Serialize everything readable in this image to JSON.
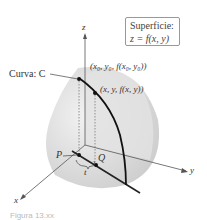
{
  "figure": {
    "surface_box": {
      "line1": "Superficie:",
      "line2": "z = f(x, y)"
    },
    "labels": {
      "curve": "Curva: C",
      "point_top": "(x₀, y₀, f(x₀, y₀))",
      "point_mid": "(x, y, f(x, y))",
      "P": "P",
      "Q": "Q",
      "t": "t",
      "axis_x": "x",
      "axis_y": "y",
      "axis_z": "z"
    },
    "caption": "Figura 13.xx"
  }
}
